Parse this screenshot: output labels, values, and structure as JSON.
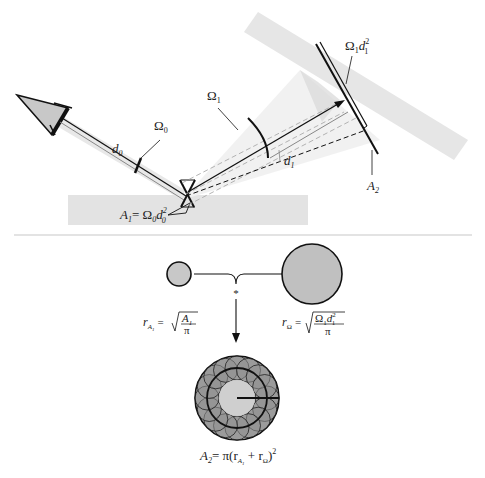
{
  "top_diagram": {
    "labels": {
      "omega0": "Ω",
      "omega0_sub": "0",
      "omega1": "Ω",
      "omega1_sub": "1",
      "d0": "d",
      "d0_sub": "0",
      "d1": "d",
      "d1_sub": "1",
      "a1_eq": "A",
      "a1_sub": "1",
      "a1_rhs": "= Ω",
      "a1_rhs_sub": "0",
      "a1_d": "d",
      "a1_d_sup": "2",
      "a1_d_sub": "0",
      "omega1d1": "Ω",
      "omega1d1_sub": "1",
      "omega1d1_d": "d",
      "omega1d1_sup": "2",
      "omega1d1_dsub": "1",
      "a2": "A",
      "a2_sub": "2"
    }
  },
  "bottom_diagram": {
    "convolution_symbol": "*",
    "r_a1": {
      "r": "r",
      "sub": "A",
      "subsub": "1",
      "eq": "=",
      "num": "A",
      "num_sub": "1",
      "den": "π"
    },
    "r_omega": {
      "r": "r",
      "sub": "Ω",
      "eq": "=",
      "num": "Ω",
      "num_sub": "1",
      "num_d": "d",
      "num_sup": "2",
      "num_dsub": "1",
      "den": "π"
    },
    "a2_formula": {
      "lhs": "A",
      "lhs_sub": "2",
      "rhs_start": "= π(r",
      "rhs_sub1": "A",
      "rhs_subsub1": "1",
      "rhs_mid": " + r",
      "rhs_sub2": "Ω",
      "rhs_end": ")",
      "rhs_sup": "2"
    }
  },
  "colors": {
    "band": "#e4e4e4",
    "cone": "#ececec",
    "circle_fill": "#c8c8c8",
    "stroke": "#111111",
    "divider": "#c8c8c8"
  }
}
